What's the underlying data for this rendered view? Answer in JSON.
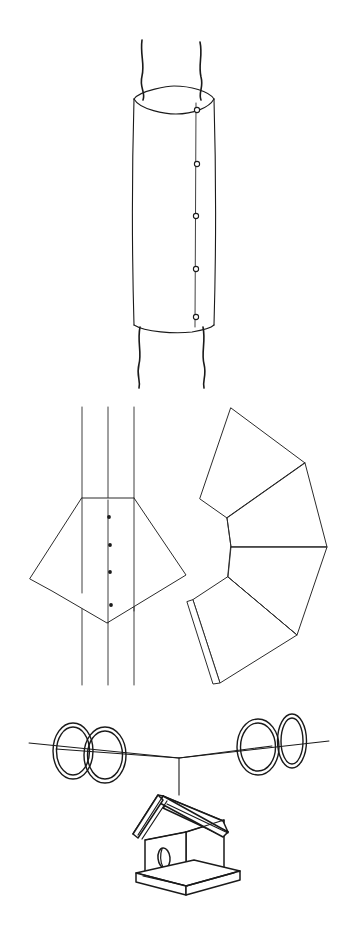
{
  "page": {
    "background_color": "#ffffff",
    "line_color": "#1a1a1a",
    "width": 350,
    "height": 933
  },
  "figures": [
    {
      "id": "fig-1",
      "name": "cylindrical-sleeve-on-post",
      "caption": "Cylindrical metal sleeve wrapped around a tree trunk / post",
      "parts": [
        {
          "name": "tree-trunk-upper",
          "type": "freehand-vertical-lines",
          "count": 2
        },
        {
          "name": "tree-trunk-lower",
          "type": "freehand-vertical-lines",
          "count": 2
        },
        {
          "name": "sleeve-body",
          "type": "cylinder"
        },
        {
          "name": "sleeve-top-rim",
          "type": "ellipse-arc"
        },
        {
          "name": "sleeve-bottom-rim",
          "type": "arc"
        },
        {
          "name": "seam-line",
          "type": "vertical-line"
        },
        {
          "name": "fastener-holes",
          "type": "small-circles",
          "count": 5
        }
      ],
      "hole_count": 5
    },
    {
      "id": "fig-2",
      "name": "flat-pattern-overlap-detail",
      "caption": "Flat sheet strip with overlapping pentagonal collar panel and rivet points",
      "parts": [
        {
          "name": "strip-edge-left",
          "type": "vertical-line"
        },
        {
          "name": "strip-center-fold",
          "type": "vertical-line"
        },
        {
          "name": "strip-edge-right",
          "type": "vertical-line"
        },
        {
          "name": "collar-panel",
          "type": "polygon"
        },
        {
          "name": "rivet-dots",
          "type": "solid-dots",
          "count": 4
        }
      ],
      "rivet_count": 4
    },
    {
      "id": "fig-3",
      "name": "unrolled-cone-fan-pattern",
      "caption": "Unrolled conical skirt development, four gores fanned about a common apex",
      "parts": [
        {
          "name": "gore-upper-left",
          "type": "quad-panel"
        },
        {
          "name": "gore-upper-right",
          "type": "quad-panel"
        },
        {
          "name": "gore-lower-right",
          "type": "quad-panel"
        },
        {
          "name": "gore-lower-left",
          "type": "quad-panel"
        },
        {
          "name": "glue-tab",
          "type": "narrow-flap"
        },
        {
          "name": "apex-point",
          "type": "vertex"
        }
      ],
      "gore_count": 4
    },
    {
      "id": "fig-4",
      "name": "suspended-birdhouse-on-wire",
      "caption": "Birdhouse hanging from a guy wire fitted with four baffle rings",
      "parts": [
        {
          "name": "support-wire",
          "type": "shallow-v-line"
        },
        {
          "name": "baffle-rings",
          "type": "double-stroke-ellipses",
          "count": 4
        },
        {
          "name": "hanger-drop-wire",
          "type": "vertical-line"
        },
        {
          "name": "birdhouse-roof",
          "type": "gable-roof-slab"
        },
        {
          "name": "birdhouse-front-wall",
          "type": "quad-face"
        },
        {
          "name": "birdhouse-side-wall",
          "type": "quad-face"
        },
        {
          "name": "entrance-hole",
          "type": "oval-aperture"
        },
        {
          "name": "base-platform",
          "type": "slab"
        }
      ],
      "ring_count": 4
    }
  ]
}
